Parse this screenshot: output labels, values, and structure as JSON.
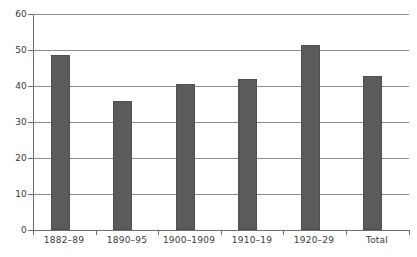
{
  "chart_data": {
    "type": "bar",
    "title": "",
    "subtitle": "",
    "xlabel": "",
    "ylabel": "",
    "categories": [
      "1882–89",
      "1890–95",
      "1900–1909",
      "1910–19",
      "1920–29",
      "Total"
    ],
    "values": [
      48.6,
      35.8,
      40.5,
      42.0,
      51.4,
      42.8
    ],
    "series": [
      {
        "name": "",
        "values": [
          48.6,
          35.8,
          40.5,
          42.0,
          51.4,
          42.8
        ]
      }
    ],
    "ylim": [
      0,
      60
    ],
    "y_ticks": [
      0,
      10,
      20,
      30,
      40,
      50,
      60
    ],
    "y_tick_labels": [
      "0",
      "10",
      "20",
      "30",
      "40",
      "50",
      "60"
    ],
    "grid": true,
    "grid_axis": "y",
    "legend": false,
    "legend_position": "none",
    "bar_color": "#5b5b5b",
    "bar_edge_color": "#4f4f4f",
    "axis_color": "#6e6e6e",
    "grid_color": "#8c8c8c",
    "background_color": "#ffffff",
    "text_color": "#3a3a3a",
    "annotations": []
  }
}
